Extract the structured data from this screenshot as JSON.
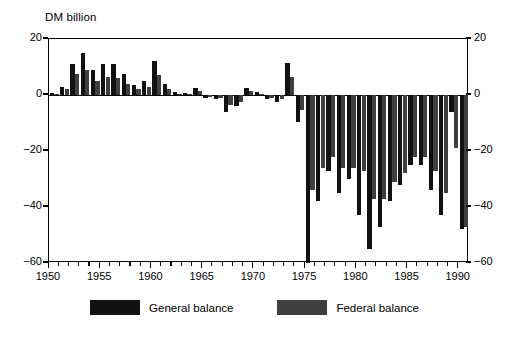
{
  "chart_data": {
    "type": "bar",
    "title": "",
    "unit_label": "DM billion",
    "xlabel": "",
    "ylabel": "DM billion",
    "ylim": [
      -60,
      20
    ],
    "yticks": [
      20,
      0,
      -20,
      -40,
      -60
    ],
    "ytick_labels_left": [
      "20",
      "0",
      "−20",
      "−40",
      "−60"
    ],
    "ytick_labels_right": [
      "20",
      "0",
      "−20",
      "−40",
      "−60"
    ],
    "xlim": [
      1950,
      1991
    ],
    "xticks_major": [
      1950,
      1955,
      1960,
      1965,
      1970,
      1975,
      1980,
      1985,
      1990
    ],
    "xtick_labels": [
      "1950",
      "1955",
      "1960",
      "1965",
      "1970",
      "1975",
      "1980",
      "1985",
      "1990"
    ],
    "grid": false,
    "legend_position": "bottom-center",
    "categories": [
      1950,
      1951,
      1952,
      1953,
      1954,
      1955,
      1956,
      1957,
      1958,
      1959,
      1960,
      1961,
      1962,
      1963,
      1964,
      1965,
      1966,
      1967,
      1968,
      1969,
      1970,
      1971,
      1972,
      1973,
      1974,
      1975,
      1976,
      1977,
      1978,
      1979,
      1980,
      1981,
      1982,
      1983,
      1984,
      1985,
      1986,
      1987,
      1988,
      1989,
      1990
    ],
    "series": [
      {
        "name": "General balance",
        "color": "#111111",
        "values": [
          0.8,
          3.0,
          11.0,
          15.0,
          9.0,
          11.0,
          11.0,
          7.5,
          3.5,
          5.0,
          12.0,
          4.0,
          1.0,
          0.6,
          2.5,
          -1.0,
          -1.5,
          -6.0,
          -4.0,
          2.5,
          1.0,
          -1.5,
          -2.5,
          11.5,
          -9.5,
          -60.0,
          -38.0,
          -27.0,
          -35.0,
          -30.0,
          -43.0,
          -55.0,
          -47.0,
          -38.0,
          -32.0,
          -25.0,
          -25.0,
          -34.0,
          -43.0,
          -6.0,
          -48.0
        ]
      },
      {
        "name": "Federal balance",
        "color": "#3f3f3f",
        "values": [
          0.5,
          2.0,
          7.5,
          9.0,
          5.0,
          6.5,
          6.0,
          4.0,
          2.0,
          3.0,
          7.0,
          2.0,
          0.5,
          0.3,
          1.5,
          -0.8,
          -1.0,
          -3.5,
          -2.5,
          1.5,
          0.5,
          -1.0,
          -1.5,
          6.5,
          -5.5,
          -34.0,
          -26.0,
          -22.0,
          -26.0,
          -26.0,
          -27.0,
          -37.0,
          -37.0,
          -31.0,
          -28.0,
          -22.0,
          -22.0,
          -27.0,
          -35.0,
          -19.0,
          -47.0
        ]
      }
    ]
  },
  "legend": {
    "items": [
      {
        "label": "General balance",
        "color": "#111111"
      },
      {
        "label": "Federal balance",
        "color": "#3f3f3f"
      }
    ]
  }
}
